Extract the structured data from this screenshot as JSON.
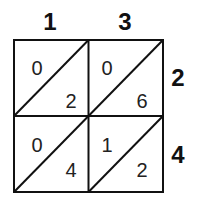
{
  "diagram": {
    "type": "lattice-multiplication",
    "top_digits": [
      "1",
      "3"
    ],
    "right_digits": [
      "2",
      "4"
    ],
    "cells": [
      [
        {
          "tens": "0",
          "ones": "2"
        },
        {
          "tens": "0",
          "ones": "6"
        }
      ],
      [
        {
          "tens": "0",
          "ones": "4"
        },
        {
          "tens": "1",
          "ones": "2"
        }
      ]
    ],
    "line_color": "#111111"
  }
}
